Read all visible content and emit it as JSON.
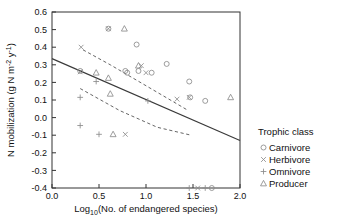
{
  "chart_data": {
    "type": "scatter",
    "title": "",
    "xlabel": "Log10(No. of endangered species)",
    "xlabel_base": "Log",
    "xlabel_sub": "10",
    "xlabel_rest": "(No. of endangered species)",
    "ylabel": "N mobilization (g N m-2 y-1)",
    "ylabel_part1": "N mobilization (g N m",
    "ylabel_sup1": "-2",
    "ylabel_part2": " y",
    "ylabel_sup2": "-1",
    "ylabel_part3": ")",
    "xlim": [
      0.0,
      2.0
    ],
    "ylim": [
      -0.4,
      0.6
    ],
    "xticks": [
      "0.0",
      "0.5",
      "1.0",
      "1.5",
      "2.0"
    ],
    "xtick_values": [
      0.0,
      0.5,
      1.0,
      1.5,
      2.0
    ],
    "yticks": [
      "0.6",
      "0.5",
      "0.4",
      "0.3",
      "0.2",
      "0.1",
      "0.0",
      "-0.1",
      "-0.2",
      "-0.3",
      "-0.4"
    ],
    "ytick_values": [
      0.6,
      0.5,
      0.4,
      0.3,
      0.2,
      0.1,
      0.0,
      -0.1,
      -0.2,
      -0.3,
      -0.4
    ],
    "grid": false,
    "legend_position": "right",
    "regression_line": {
      "name": "fitted regression",
      "style": "solid",
      "x": [
        0.0,
        2.0
      ],
      "y": [
        0.335,
        -0.13
      ]
    },
    "confidence_bands": [
      {
        "name": "upper confidence band",
        "style": "dashed",
        "x": [
          0.33,
          0.62,
          1.02,
          1.45
        ],
        "y": [
          0.385,
          0.3,
          0.175,
          0.04
        ]
      },
      {
        "name": "lower confidence band",
        "style": "dashed",
        "x": [
          0.3,
          0.72,
          1.12,
          1.48
        ],
        "y": [
          0.165,
          0.04,
          -0.055,
          -0.1
        ]
      }
    ],
    "series": [
      {
        "name": "Carnivore",
        "marker": "circle-open",
        "points": [
          [
            0.3,
            0.265
          ],
          [
            0.6,
            0.505
          ],
          [
            0.78,
            0.265
          ],
          [
            0.8,
            0.255
          ],
          [
            0.9,
            0.415
          ],
          [
            0.92,
            0.265
          ],
          [
            1.06,
            0.255
          ],
          [
            1.22,
            0.305
          ],
          [
            1.46,
            0.205
          ],
          [
            1.47,
            0.115
          ],
          [
            1.63,
            0.095
          ],
          [
            1.7,
            -0.4
          ]
        ]
      },
      {
        "name": "Herbivore",
        "marker": "x",
        "points": [
          [
            0.3,
            0.26
          ],
          [
            0.31,
            0.4
          ],
          [
            0.6,
            0.505
          ],
          [
            0.78,
            -0.095
          ],
          [
            0.95,
            0.295
          ],
          [
            1.0,
            0.255
          ],
          [
            1.33,
            0.105
          ],
          [
            1.46,
            0.115
          ],
          [
            1.55,
            -0.4
          ]
        ]
      },
      {
        "name": "Omnivore",
        "marker": "plus",
        "points": [
          [
            0.3,
            0.115
          ],
          [
            0.3,
            -0.045
          ],
          [
            0.47,
            0.205
          ],
          [
            0.5,
            -0.095
          ],
          [
            1.02,
            0.095
          ],
          [
            1.46,
            -0.4
          ],
          [
            1.63,
            -0.4
          ]
        ]
      },
      {
        "name": "Producer",
        "marker": "triangle-open",
        "points": [
          [
            0.47,
            0.255
          ],
          [
            0.6,
            0.225
          ],
          [
            0.62,
            0.135
          ],
          [
            0.65,
            -0.095
          ],
          [
            0.77,
            0.505
          ],
          [
            0.92,
            0.295
          ],
          [
            1.9,
            0.115
          ]
        ]
      }
    ]
  },
  "legend": {
    "title": "Trophic class",
    "items": [
      {
        "label": "Carnivore",
        "marker": "circle-open"
      },
      {
        "label": "Herbivore",
        "marker": "x"
      },
      {
        "label": "Omnivore",
        "marker": "plus"
      },
      {
        "label": "Producer",
        "marker": "triangle-open"
      }
    ]
  }
}
